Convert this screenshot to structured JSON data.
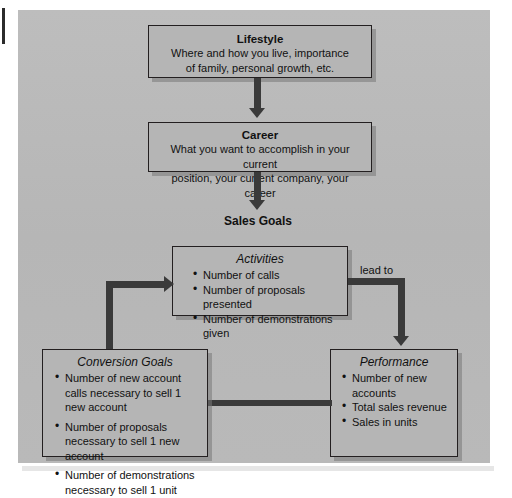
{
  "diagram": {
    "background_color": "#b9b9b9",
    "box_fill_color": "#b5b5b5",
    "line_color": "#3a3a3a",
    "text_color": "#111111",
    "nodes": {
      "lifestyle": {
        "title": "Lifestyle",
        "line1": "Where and how you live, importance",
        "line2": "of family, personal growth, etc."
      },
      "career": {
        "title": "Career",
        "line1": "What you want to accomplish in your current",
        "line2": "position, your current company, your career"
      },
      "sales_goals": {
        "title": "Sales Goals"
      },
      "activities": {
        "title": "Activities",
        "items": [
          "Number of calls",
          "Number of proposals presented",
          "Number of demonstrations given"
        ]
      },
      "conversion_goals": {
        "title": "Conversion Goals",
        "items": [
          "Number of new account calls necessary to sell 1 new account",
          "Number of proposals necessary to sell 1 new account",
          "Number of demonstrations necessary to sell 1 unit"
        ]
      },
      "performance": {
        "title": "Performance",
        "items": [
          "Number of new accounts",
          "Total sales revenue",
          "Sales in units"
        ]
      }
    },
    "edges": {
      "activities_to_performance_label": "lead to"
    }
  }
}
